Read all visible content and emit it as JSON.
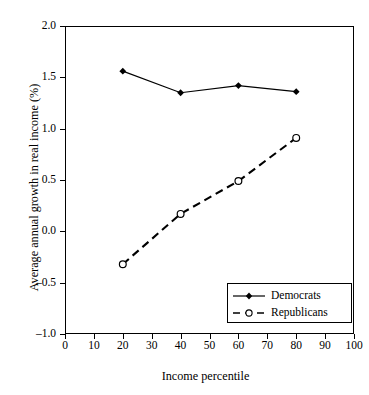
{
  "chart_data": {
    "type": "line",
    "title": "",
    "xlabel": "Income percentile",
    "ylabel": "Average annual growth in real income (%)",
    "x": [
      20,
      40,
      60,
      80
    ],
    "xlim": [
      0,
      100
    ],
    "ylim": [
      -1.0,
      2.0
    ],
    "xticks": [
      0,
      10,
      20,
      30,
      40,
      50,
      60,
      70,
      80,
      90,
      100
    ],
    "yticks": [
      -1.0,
      -0.5,
      0.0,
      0.5,
      1.0,
      1.5,
      2.0
    ],
    "xticklabels": [
      "0",
      "10",
      "20",
      "30",
      "40",
      "50",
      "60",
      "70",
      "80",
      "90",
      "100"
    ],
    "yticklabels": [
      "-1.0",
      "-0.5",
      "0.0",
      "0.5",
      "1.0",
      "1.5",
      "2.0"
    ],
    "grid": false,
    "legend_position": "lower right",
    "series": [
      {
        "name": "Democrats",
        "values": [
          1.56,
          1.35,
          1.42,
          1.36
        ],
        "linestyle": "solid",
        "marker": "filled-diamond",
        "color": "#000000"
      },
      {
        "name": "Republicans",
        "values": [
          -0.32,
          0.17,
          0.49,
          0.91
        ],
        "linestyle": "dashed",
        "marker": "open-circle",
        "color": "#000000"
      }
    ]
  },
  "legend": {
    "entries": [
      {
        "label": "Democrats"
      },
      {
        "label": "Republicans"
      }
    ]
  }
}
